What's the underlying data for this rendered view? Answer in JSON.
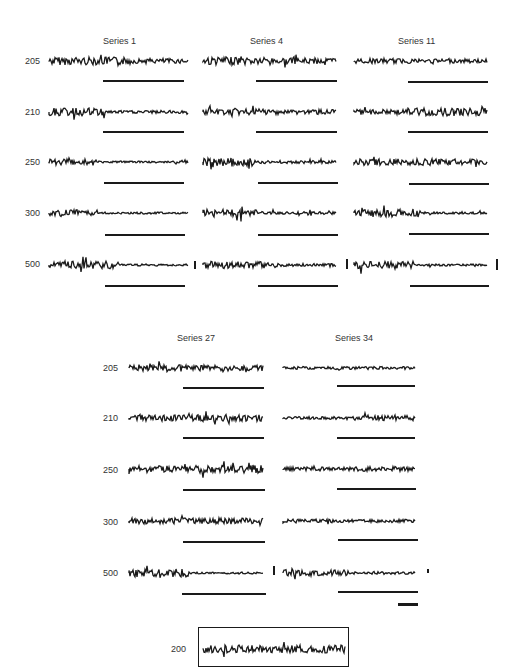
{
  "figure": {
    "panel_top": {
      "series": [
        "Series 1",
        "Series 4",
        "Series 11"
      ],
      "rows": [
        "205",
        "210",
        "250",
        "300",
        "500"
      ]
    },
    "panel_middle": {
      "series": [
        "Series 27",
        "Series 34"
      ],
      "rows": [
        "205",
        "210",
        "250",
        "300",
        "500"
      ]
    },
    "panel_bottom": {
      "rows": [
        "200"
      ]
    },
    "trace_color": "#1a1a1a",
    "background_color": "#ffffff"
  }
}
